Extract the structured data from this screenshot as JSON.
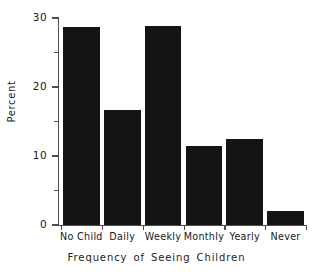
{
  "chart_data": {
    "type": "bar",
    "title": "",
    "subtitle": "",
    "xlabel": "Frequency of Seeing Children",
    "ylabel": "Percent",
    "categories": [
      "No Child",
      "Daily",
      "Weekly",
      "Monthly",
      "Yearly",
      "Never"
    ],
    "values": [
      28.7,
      16.6,
      28.8,
      11.5,
      12.4,
      2.0
    ],
    "ylim": [
      0,
      30
    ],
    "y_major_ticks": [
      0,
      10,
      20,
      30
    ],
    "y_minor_ticks": [
      5,
      15,
      25
    ],
    "y_tick_labels": [
      "0",
      "10",
      "20",
      "30"
    ],
    "grid": false,
    "legend": false,
    "legend_position": "none",
    "bar_color": "#141414",
    "axis_color": "#4d4d4d",
    "background_color": "#ffffff"
  },
  "axes": {
    "y_title": "Percent",
    "x_title": "Frequency of Seeing Children"
  }
}
